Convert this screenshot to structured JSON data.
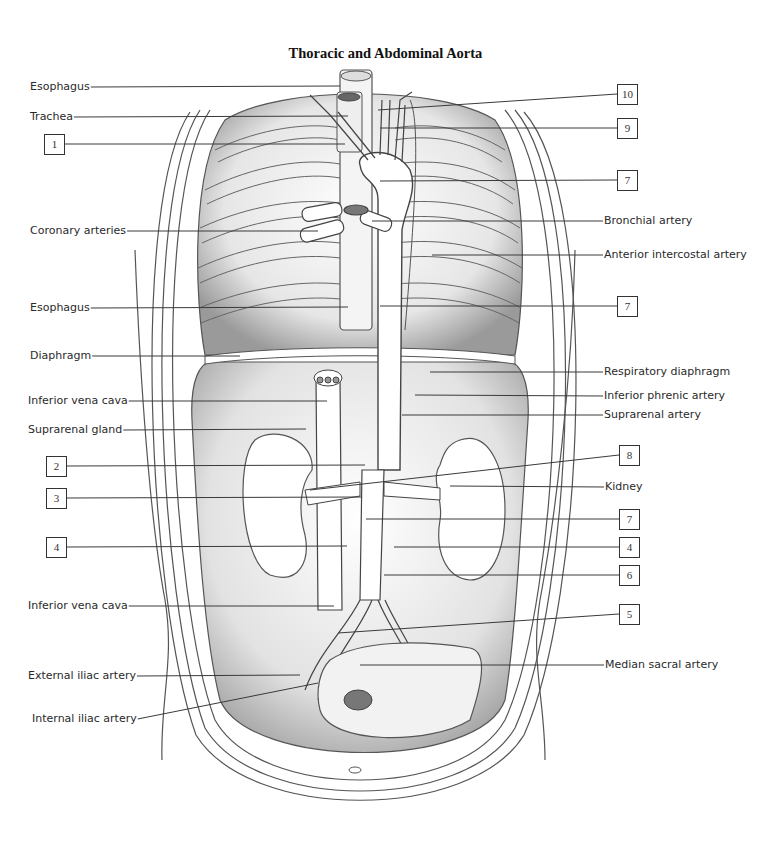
{
  "title": "Thoracic and Abdominal Aorta",
  "colors": {
    "line": "#3a3a3a",
    "outline": "#555555",
    "shade": "#cfcfcf",
    "light": "#eeeeee",
    "background": "#ffffff"
  },
  "labels_left": [
    {
      "id": "esophagus-top",
      "text": "Esophagus",
      "x": 30,
      "y": 80,
      "line_to": [
        340,
        86
      ]
    },
    {
      "id": "trachea",
      "text": "Trachea",
      "x": 30,
      "y": 110,
      "line_to": [
        348,
        116
      ]
    },
    {
      "id": "coronary-arteries",
      "text": "Coronary arteries",
      "x": 30,
      "y": 224,
      "line_to": [
        318,
        231
      ]
    },
    {
      "id": "esophagus-mid",
      "text": "Esophagus",
      "x": 30,
      "y": 301,
      "line_to": [
        348,
        307
      ]
    },
    {
      "id": "diaphragm",
      "text": "Diaphragm",
      "x": 30,
      "y": 349,
      "line_to": [
        240,
        356
      ]
    },
    {
      "id": "inferior-vena-cava-top",
      "text": "Inferior vena cava",
      "x": 28,
      "y": 394,
      "line_to": [
        327,
        401
      ]
    },
    {
      "id": "suprarenal-gland",
      "text": "Suprarenal gland",
      "x": 28,
      "y": 423,
      "line_to": [
        306,
        429
      ]
    },
    {
      "id": "inferior-vena-cava-bottom",
      "text": "Inferior vena cava",
      "x": 28,
      "y": 599,
      "line_to": [
        334,
        606
      ]
    },
    {
      "id": "external-iliac-artery",
      "text": "External iliac artery",
      "x": 28,
      "y": 669,
      "line_to": [
        300,
        675
      ]
    },
    {
      "id": "internal-iliac-artery",
      "text": "Internal iliac artery",
      "x": 32,
      "y": 712,
      "line_to": [
        318,
        683
      ]
    }
  ],
  "boxes_left": [
    {
      "id": "1",
      "text": "1",
      "x": 44,
      "y": 134,
      "line_to": [
        345,
        144
      ]
    },
    {
      "id": "2",
      "text": "2",
      "x": 46,
      "y": 456,
      "line_to": [
        365,
        465
      ]
    },
    {
      "id": "3",
      "text": "3",
      "x": 46,
      "y": 488,
      "line_to": [
        362,
        497
      ]
    },
    {
      "id": "4-left",
      "text": "4",
      "x": 46,
      "y": 537,
      "line_to": [
        347,
        546
      ]
    }
  ],
  "labels_right": [
    {
      "id": "bronchial-artery",
      "text": "Bronchial artery",
      "x": 604,
      "y": 214,
      "line_to": [
        372,
        221
      ]
    },
    {
      "id": "anterior-intercostal-artery",
      "text": "Anterior intercostal artery",
      "x": 604,
      "y": 248,
      "line_to": [
        432,
        255
      ]
    },
    {
      "id": "respiratory-diaphragm",
      "text": "Respiratory diaphragm",
      "x": 604,
      "y": 365,
      "line_to": [
        430,
        372
      ]
    },
    {
      "id": "inferior-phrenic-artery",
      "text": "Inferior phrenic artery",
      "x": 604,
      "y": 389,
      "line_to": [
        415,
        395
      ]
    },
    {
      "id": "suprarenal-artery",
      "text": "Suprarenal artery",
      "x": 604,
      "y": 408,
      "line_to": [
        402,
        415
      ]
    },
    {
      "id": "kidney",
      "text": "Kidney",
      "x": 605,
      "y": 480,
      "line_to": [
        450,
        486
      ]
    },
    {
      "id": "median-sacral-artery",
      "text": "Median sacral artery",
      "x": 605,
      "y": 658,
      "line_to": [
        360,
        665
      ]
    }
  ],
  "boxes_right": [
    {
      "id": "10",
      "text": "10",
      "x": 617,
      "y": 84,
      "line_to": [
        378,
        110
      ]
    },
    {
      "id": "9",
      "text": "9",
      "x": 617,
      "y": 118,
      "line_to": [
        380,
        128
      ]
    },
    {
      "id": "7-a",
      "text": "7",
      "x": 617,
      "y": 170,
      "line_to": [
        380,
        181
      ]
    },
    {
      "id": "7-b",
      "text": "7",
      "x": 617,
      "y": 296,
      "line_to": [
        380,
        306
      ]
    },
    {
      "id": "8",
      "text": "8",
      "x": 619,
      "y": 445,
      "line_to": [
        310,
        490
      ]
    },
    {
      "id": "7-c",
      "text": "7",
      "x": 619,
      "y": 509,
      "line_to": [
        366,
        519
      ]
    },
    {
      "id": "4-right",
      "text": "4",
      "x": 619,
      "y": 537,
      "line_to": [
        394,
        547
      ]
    },
    {
      "id": "6",
      "text": "6",
      "x": 619,
      "y": 565,
      "line_to": [
        384,
        575
      ]
    },
    {
      "id": "5",
      "text": "5",
      "x": 619,
      "y": 604,
      "line_to": [
        338,
        633
      ]
    }
  ]
}
